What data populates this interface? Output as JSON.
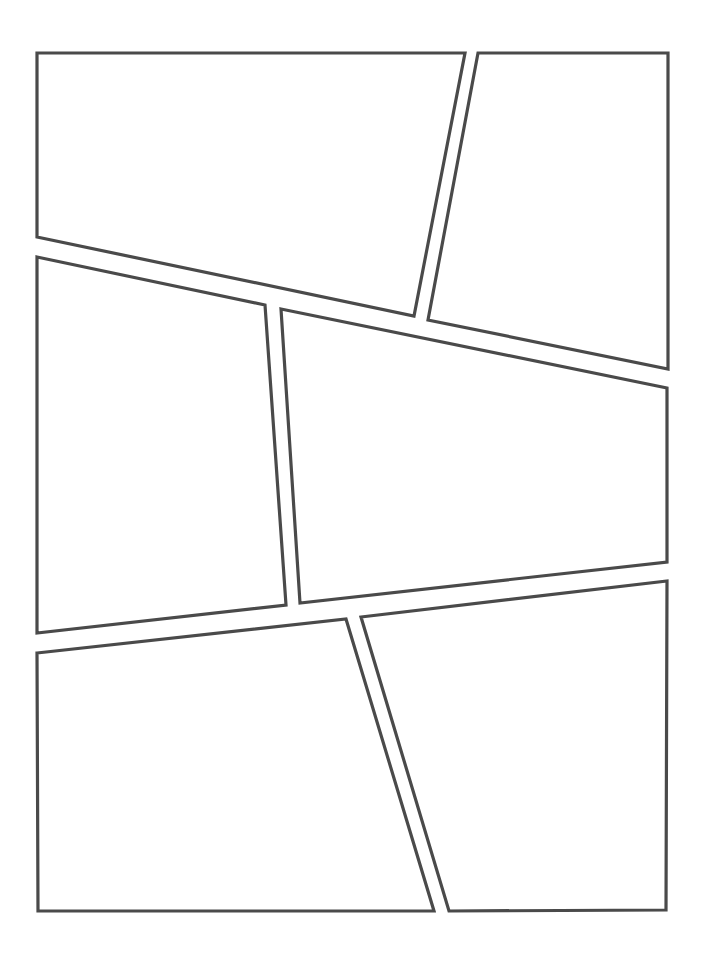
{
  "page": {
    "width": 705,
    "height": 954,
    "background": "#ffffff",
    "stroke_color": "#4a4a4a",
    "stroke_width": 3.2
  },
  "panels": [
    {
      "id": "panel-1",
      "points": [
        [
          37,
          53
        ],
        [
          465,
          53
        ],
        [
          414,
          316
        ],
        [
          37,
          237
        ]
      ]
    },
    {
      "id": "panel-2",
      "points": [
        [
          478,
          53
        ],
        [
          668,
          53
        ],
        [
          668,
          369
        ],
        [
          428,
          320
        ]
      ]
    },
    {
      "id": "panel-3",
      "points": [
        [
          37,
          257
        ],
        [
          265,
          305
        ],
        [
          286,
          605
        ],
        [
          37,
          633
        ]
      ]
    },
    {
      "id": "panel-4",
      "points": [
        [
          281,
          309
        ],
        [
          667,
          388
        ],
        [
          667,
          562
        ],
        [
          300,
          603
        ]
      ]
    },
    {
      "id": "panel-5",
      "points": [
        [
          37,
          653
        ],
        [
          346,
          619
        ],
        [
          434,
          911
        ],
        [
          38,
          911
        ]
      ]
    },
    {
      "id": "panel-6",
      "points": [
        [
          361,
          617
        ],
        [
          667,
          581
        ],
        [
          666,
          910
        ],
        [
          449,
          911
        ]
      ]
    }
  ]
}
